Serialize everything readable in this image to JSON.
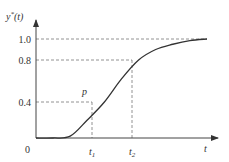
{
  "chart_data": {
    "type": "line",
    "title": "",
    "xlabel": "t",
    "ylabel": "y*(t)",
    "ylabel_parts": {
      "base": "y",
      "sup": "*",
      "arg": "(t)"
    },
    "origin_label": "0",
    "y_ticks": [
      {
        "value": 0.4,
        "label": "0.4"
      },
      {
        "value": 0.8,
        "label": "0.8"
      },
      {
        "value": 1.0,
        "label": "1.0"
      }
    ],
    "x_marks": [
      {
        "name": "t1",
        "base": "t",
        "sub": "1",
        "y_value": 0.4
      },
      {
        "name": "t2",
        "base": "t",
        "sub": "2",
        "y_value": 0.8
      }
    ],
    "point_label": "p",
    "ylim": [
      0,
      1.0
    ],
    "grid": false,
    "series": [
      {
        "name": "y*(t)",
        "description": "S-shaped step response rising from 0 to 1.0",
        "x": [
          0,
          0.1,
          0.2,
          0.3,
          0.4,
          0.5,
          0.6,
          0.7,
          0.8,
          0.9,
          1.0
        ],
        "values": [
          0,
          0,
          0.02,
          0.2,
          0.4,
          0.62,
          0.8,
          0.9,
          0.95,
          0.985,
          1.0
        ]
      }
    ]
  }
}
